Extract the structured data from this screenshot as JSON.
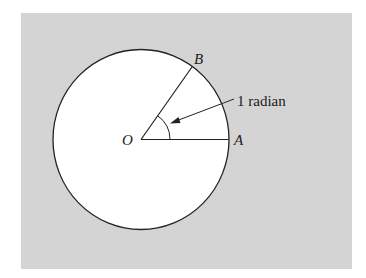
{
  "diagram": {
    "colors": {
      "panel": "#d4d4d4",
      "circle_fill": "#ffffff",
      "stroke": "#222222"
    },
    "points": {
      "center": {
        "label": "O",
        "x": 141,
        "y": 139.5
      },
      "a": {
        "label": "A",
        "x": 229,
        "y": 139.5
      },
      "b": {
        "label": "B",
        "x": 192,
        "y": 67
      }
    },
    "circle": {
      "cx": 141,
      "cy": 139.5,
      "rx": 88,
      "ry": 90
    },
    "angle": {
      "label": "1 radian",
      "arc_radius": 29
    },
    "labels": {
      "o": "O",
      "a": "A",
      "b": "B",
      "radian": "1 radian"
    }
  }
}
